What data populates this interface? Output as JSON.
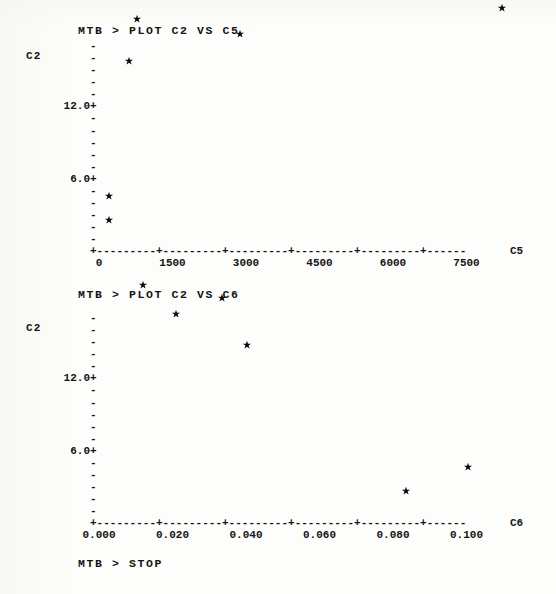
{
  "terminal": {
    "prompt_1": "MTB > PLOT C2 VS C5",
    "prompt_2": "MTB > PLOT C2 VS C6",
    "prompt_3": "MTB > STOP"
  },
  "chart_data": [
    {
      "type": "scatter",
      "title": "MTB > PLOT C2 VS C5",
      "xlabel": "C5",
      "ylabel": "C2",
      "xlim": [
        0,
        8500
      ],
      "ylim": [
        0,
        21
      ],
      "xticks": [
        "0",
        "1500",
        "3000",
        "4500",
        "6000",
        "7500"
      ],
      "xtick_values": [
        0,
        1500,
        3000,
        4500,
        6000,
        7500
      ],
      "yticks": [
        "18.0+",
        "12.0+",
        "6.0+"
      ],
      "ytick_values": [
        18.0,
        12.0,
        6.0
      ],
      "marker": "*",
      "grid": false,
      "legend": "none",
      "points": [
        {
          "x": 750,
          "y": 19.4
        },
        {
          "x": 2860,
          "y": 18.2
        },
        {
          "x": 600,
          "y": 15.9
        },
        {
          "x": 8200,
          "y": 20.3
        },
        {
          "x": 180,
          "y": 4.7
        },
        {
          "x": 180,
          "y": 2.7
        }
      ]
    },
    {
      "type": "scatter",
      "title": "MTB > PLOT C2 VS C6",
      "xlabel": "C6",
      "ylabel": "C2",
      "xlim": [
        0.0,
        0.115
      ],
      "ylim": [
        0,
        21
      ],
      "xticks": [
        "0.000",
        "0.020",
        "0.040",
        "0.060",
        "0.080",
        "0.100"
      ],
      "xtick_values": [
        0.0,
        0.02,
        0.04,
        0.06,
        0.08,
        0.1
      ],
      "yticks": [
        "18.0+",
        "12.0+",
        "6.0+"
      ],
      "ytick_values": [
        18.0,
        12.0,
        6.0
      ],
      "marker": "*",
      "grid": false,
      "legend": "none",
      "points": [
        {
          "x": 0.0118,
          "y": 19.9
        },
        {
          "x": 0.0208,
          "y": 17.5
        },
        {
          "x": 0.0332,
          "y": 18.8
        },
        {
          "x": 0.04,
          "y": 14.9
        },
        {
          "x": 0.0832,
          "y": 2.8
        },
        {
          "x": 0.1,
          "y": 4.8
        }
      ]
    }
  ],
  "axis_art": {
    "xaxis_row": "+---------+---------+---------+---------+---------+------",
    "ytick_dash": "-",
    "ytick_plus": "+"
  }
}
